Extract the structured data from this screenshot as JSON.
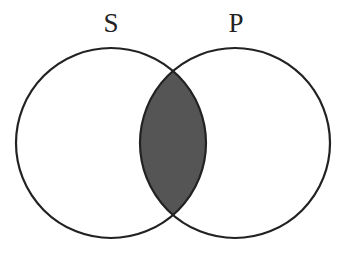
{
  "diagram": {
    "type": "venn",
    "sets": [
      {
        "label": "S",
        "cx": 111,
        "cy": 143,
        "r": 95
      },
      {
        "label": "P",
        "cx": 235,
        "cy": 143,
        "r": 95
      }
    ],
    "shaded_region": "S ∩ P",
    "colors": {
      "stroke": "#222222",
      "shade": "#555555",
      "background": "#ffffff"
    }
  }
}
